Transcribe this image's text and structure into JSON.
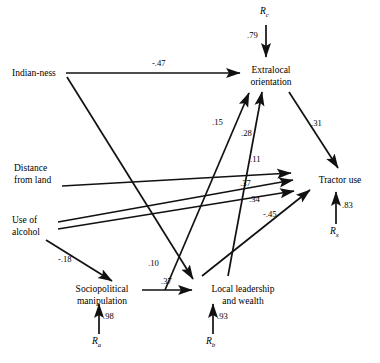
{
  "figure": {
    "type": "path-diagram",
    "stroke_color": "#111111",
    "background_color": "#ffffff"
  },
  "nodes": [
    {
      "id": "indian_ness",
      "label_line1": "Indian-ness",
      "label_line2": "",
      "x": 12,
      "y": 68,
      "align": "left"
    },
    {
      "id": "distance_land",
      "label_line1": "Distance",
      "label_line2": "from land",
      "x": 14,
      "y": 163,
      "align": "left"
    },
    {
      "id": "use_alcohol",
      "label_line1": "Use of",
      "label_line2": "alcohol",
      "x": 12,
      "y": 222,
      "align": "left"
    },
    {
      "id": "sociopolitical",
      "label_line1": "Sociopolitical",
      "label_line2": "manipulation",
      "x": 82,
      "y": 285,
      "align": "center"
    },
    {
      "id": "local_leader",
      "label_line1": "Local leadership",
      "label_line2": "and wealth",
      "x": 196,
      "y": 285,
      "align": "center"
    },
    {
      "id": "extralocal",
      "label_line1": "Extralocal",
      "label_line2": "orientation",
      "x": 248,
      "y": 66,
      "align": "center"
    },
    {
      "id": "tractor_use",
      "label_line1": "Tractor use",
      "label_line2": "",
      "x": 320,
      "y": 179,
      "align": "center"
    }
  ],
  "residuals": [
    {
      "id": "r_c",
      "letter": "R",
      "subscript": "c",
      "coefficient": ".79",
      "x": 262,
      "y": 8,
      "coef_x": 247,
      "coef_y": 32
    },
    {
      "id": "r_x",
      "letter": "R",
      "subscript": "x",
      "coefficient": ".83",
      "x": 330,
      "y": 228,
      "coef_x": 344,
      "coef_y": 203
    },
    {
      "id": "r_a",
      "letter": "R",
      "subscript": "a",
      "coefficient": ".98",
      "x": 92,
      "y": 338,
      "coef_x": 104,
      "coef_y": 314
    },
    {
      "id": "r_b",
      "letter": "R",
      "subscript": "b",
      "coefficient": ".93",
      "x": 206,
      "y": 338,
      "coef_x": 218,
      "coef_y": 314
    }
  ],
  "edges": [
    {
      "id": "e_indian_extralocal",
      "from": "indian_ness",
      "to": "extralocal",
      "coefficient": "-.47",
      "label_x": 161,
      "label_y": 62
    },
    {
      "id": "e_indian_locallead",
      "from": "indian_ness",
      "to": "local_leader",
      "coefficient": ".10",
      "label_x": 150,
      "label_y": 263
    },
    {
      "id": "e_alcohol_sociopol",
      "from": "use_alcohol",
      "to": "sociopolitical",
      "coefficient": "-.18",
      "label_x": 62,
      "label_y": 258
    },
    {
      "id": "e_alcohol_tractor",
      "from": "use_alcohol",
      "to": "tractor_use",
      "coefficient": ".37",
      "label_x": 243,
      "label_y": 182
    },
    {
      "id": "e_alcohol_tractor2",
      "from": "use_alcohol",
      "to": "tractor_use",
      "coefficient": ".34",
      "label_x": 252,
      "label_y": 198
    },
    {
      "id": "e_distance_tractor",
      "from": "distance_land",
      "to": "tractor_use",
      "coefficient": ".11",
      "label_x": 253,
      "label_y": 158
    },
    {
      "id": "e_sociopol_extralocal",
      "from": "sociopolitical",
      "to": "extralocal",
      "coefficient": ".15",
      "label_x": 214,
      "label_y": 121
    },
    {
      "id": "e_locallead_extralocal",
      "from": "local_leader",
      "to": "extralocal",
      "coefficient": ".28",
      "label_x": 243,
      "label_y": 131
    },
    {
      "id": "e_sociopol_locallead",
      "from": "sociopolitical",
      "to": "local_leader",
      "coefficient": ".37",
      "label_x": 163,
      "label_y": 281
    },
    {
      "id": "e_locallead_tractor",
      "from": "local_leader",
      "to": "tractor_use",
      "coefficient": "-.45",
      "label_x": 266,
      "label_y": 212
    },
    {
      "id": "e_extralocal_tractor",
      "from": "extralocal",
      "to": "tractor_use",
      "coefficient": ".31",
      "label_x": 313,
      "label_y": 122
    }
  ]
}
